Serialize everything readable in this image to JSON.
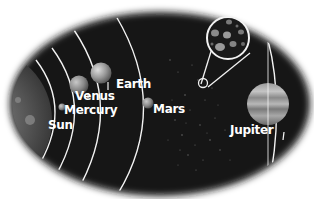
{
  "diagram": {
    "type": "solar-system-inner-planets",
    "background_color": "#ffffff",
    "space_color": "#141414",
    "orbit_color": "#f2f2f2",
    "labels": {
      "sun": "Sun",
      "mercury": "Mercury",
      "venus": "Venus",
      "earth": "Earth",
      "mars": "Mars",
      "jupiter": "Jupiter"
    },
    "callout": {
      "subject": "asteroid-belt-magnified"
    }
  }
}
